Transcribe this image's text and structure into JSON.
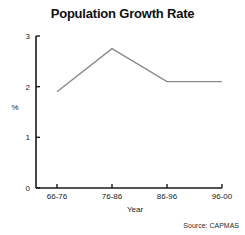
{
  "chart_data": {
    "type": "line",
    "title": "Population Growth Rate",
    "xlabel": "Year",
    "ylabel": "%",
    "categories": [
      "66-76",
      "76-86",
      "86-96",
      "96-00"
    ],
    "values": [
      1.9,
      2.75,
      2.1,
      2.1
    ],
    "yticks": [
      "0",
      "1",
      "2",
      "3"
    ],
    "ytick_values": [
      0,
      1,
      2,
      3
    ],
    "ylim": [
      0,
      3
    ],
    "grid": false,
    "legend": false,
    "line_color": "#8a8a8a",
    "axis_color": "#1a1a1a",
    "background": "#ffffff"
  },
  "source": {
    "note": "Source: CAPMAS"
  }
}
